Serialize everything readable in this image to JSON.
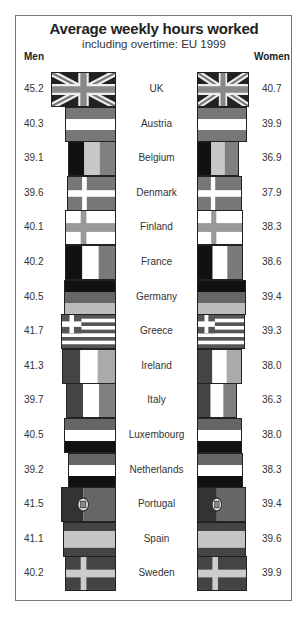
{
  "chart_data": {
    "type": "bar",
    "title": "Average weekly hours worked",
    "subtitle": "including overtime: EU 1999",
    "left_label": "Men",
    "right_label": "Women",
    "categories": [
      "UK",
      "Austria",
      "Belgium",
      "Denmark",
      "Finland",
      "France",
      "Germany",
      "Greece",
      "Ireland",
      "Italy",
      "Luxembourg",
      "Netherlands",
      "Portugal",
      "Spain",
      "Sweden"
    ],
    "series": [
      {
        "name": "Men",
        "values": [
          45.2,
          40.3,
          39.1,
          39.6,
          40.1,
          40.2,
          40.5,
          41.7,
          41.3,
          39.7,
          40.5,
          39.2,
          41.5,
          41.1,
          40.2
        ]
      },
      {
        "name": "Women",
        "values": [
          40.7,
          39.9,
          36.9,
          37.9,
          38.3,
          38.6,
          39.4,
          39.3,
          38.0,
          36.3,
          38.0,
          38.3,
          39.4,
          39.6,
          39.9
        ]
      }
    ],
    "bar_style": "flag pictograms, width proportional to hours, back-to-back",
    "legend": "none"
  },
  "rows": [
    {
      "country": "UK",
      "men": "45.2",
      "women": "40.7",
      "flag": "uk"
    },
    {
      "country": "Austria",
      "men": "40.3",
      "women": "39.9",
      "flag": "austria"
    },
    {
      "country": "Belgium",
      "men": "39.1",
      "women": "36.9",
      "flag": "belgium"
    },
    {
      "country": "Denmark",
      "men": "39.6",
      "women": "37.9",
      "flag": "denmark"
    },
    {
      "country": "Finland",
      "men": "40.1",
      "women": "38.3",
      "flag": "finland"
    },
    {
      "country": "France",
      "men": "40.2",
      "women": "38.6",
      "flag": "france"
    },
    {
      "country": "Germany",
      "men": "40.5",
      "women": "39.4",
      "flag": "germany"
    },
    {
      "country": "Greece",
      "men": "41.7",
      "women": "39.3",
      "flag": "greece"
    },
    {
      "country": "Ireland",
      "men": "41.3",
      "women": "38.0",
      "flag": "ireland"
    },
    {
      "country": "Italy",
      "men": "39.7",
      "women": "36.3",
      "flag": "italy"
    },
    {
      "country": "Luxembourg",
      "men": "40.5",
      "women": "38.0",
      "flag": "luxembourg"
    },
    {
      "country": "Netherlands",
      "men": "39.2",
      "women": "38.3",
      "flag": "netherlands"
    },
    {
      "country": "Portugal",
      "men": "41.5",
      "women": "39.4",
      "flag": "portugal"
    },
    {
      "country": "Spain",
      "men": "41.1",
      "women": "39.6",
      "flag": "spain"
    },
    {
      "country": "Sweden",
      "men": "40.2",
      "women": "39.9",
      "flag": "sweden"
    }
  ]
}
